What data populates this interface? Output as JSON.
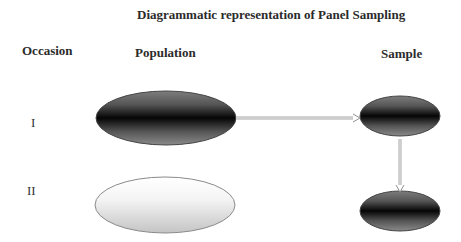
{
  "title": "Diagrammatic representation of Panel Sampling",
  "columns": {
    "occasion": "Occasion",
    "population": "Population",
    "sample": "Sample"
  },
  "rows": [
    {
      "label": "I"
    },
    {
      "label": "II"
    }
  ],
  "shapes": {
    "population_1": {
      "cx": 166,
      "cy": 118,
      "rx": 70,
      "ry": 27,
      "fill": "dark"
    },
    "population_2": {
      "cx": 165,
      "cy": 205,
      "rx": 70,
      "ry": 28,
      "fill": "light"
    },
    "sample_1": {
      "cx": 400,
      "cy": 116,
      "rx": 40,
      "ry": 20,
      "fill": "dark"
    },
    "sample_2": {
      "cx": 400,
      "cy": 211,
      "rx": 40,
      "ry": 20,
      "fill": "dark"
    }
  },
  "arrows": [
    {
      "from": "population_1",
      "to": "sample_1",
      "direction": "right"
    },
    {
      "from": "sample_1",
      "to": "sample_2",
      "direction": "down"
    }
  ],
  "colors": {
    "dark_core": "#0a0a0a",
    "dark_edge": "#8a8a8a",
    "light_top": "#ffffff",
    "light_bottom": "#c8c8c8",
    "outline": "#555555",
    "arrow": "#a0a0a0"
  }
}
